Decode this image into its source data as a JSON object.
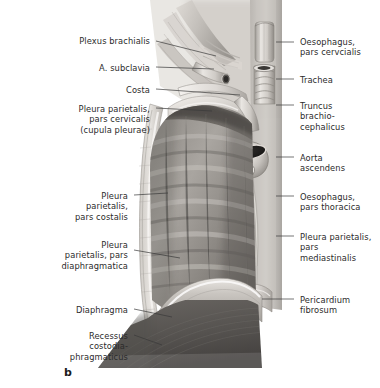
{
  "figure": {
    "letter": "b",
    "letter_x": 64,
    "letter_y": 366,
    "style": "grayscale anatomical illustration",
    "width": 380,
    "height": 388,
    "background_color": "#ffffff",
    "text_color": "#2b2b2b",
    "leader_color": "#3a3a3a"
  },
  "labels_left": [
    {
      "name": "plexus-brachialis",
      "text": "Plexus brachialis",
      "text_x": 150,
      "text_y": 36,
      "leader": {
        "x1": 156,
        "y1": 41,
        "x2": 216,
        "y2": 56
      }
    },
    {
      "name": "a-subclavia",
      "text": "A. subclavia",
      "text_y": 63,
      "text_x": 150,
      "leader": {
        "x1": 156,
        "y1": 67,
        "x2": 214,
        "y2": 69
      }
    },
    {
      "name": "costa",
      "text": "Costa",
      "text_x": 150,
      "text_y": 85,
      "leader": {
        "x1": 156,
        "y1": 89,
        "x2": 240,
        "y2": 95
      }
    },
    {
      "name": "pleura-parietalis-pars-cervicalis",
      "text": "Pleura parietalis,\npars cervicalis\n(cupula pleurae)",
      "text_x": 150,
      "text_y": 104,
      "leader": {
        "x1": 156,
        "y1": 108,
        "x2": 212,
        "y2": 111
      }
    },
    {
      "name": "pleura-parietalis-pars-costalis",
      "text": "Pleura\nparietalis,\npars costalis",
      "text_x": 128,
      "text_y": 191,
      "leader": {
        "x1": 134,
        "y1": 195,
        "x2": 168,
        "y2": 193
      }
    },
    {
      "name": "pleura-parietalis-pars-diaphragmatica",
      "text": "Pleura\nparietalis, pars\ndiaphragmatica",
      "text_x": 128,
      "text_y": 240,
      "leader": {
        "x1": 134,
        "y1": 250,
        "x2": 180,
        "y2": 258
      }
    },
    {
      "name": "diaphragma",
      "text": "Diaphragma",
      "text_x": 128,
      "text_y": 305,
      "leader": {
        "x1": 134,
        "y1": 309,
        "x2": 172,
        "y2": 317
      }
    },
    {
      "name": "recessus-costodiaphragmaticus",
      "text": "Recessus\ncostodia-\nphragmaticus",
      "text_x": 128,
      "text_y": 331,
      "leader": {
        "x1": 134,
        "y1": 335,
        "x2": 162,
        "y2": 345
      }
    }
  ],
  "labels_right": [
    {
      "name": "oesophagus-pars-cervicalis",
      "text": "Oesophagus,\npars cervcialis",
      "text_x": 300,
      "text_y": 37,
      "leader": {
        "x1": 276,
        "y1": 42,
        "x2": 294,
        "y2": 42
      }
    },
    {
      "name": "trachea",
      "text": "Trachea",
      "text_x": 300,
      "text_y": 75,
      "leader": {
        "x1": 276,
        "y1": 79,
        "x2": 294,
        "y2": 79
      }
    },
    {
      "name": "truncus-brachiocephalicus",
      "text": "Truncus\nbrachio-\ncephalicus",
      "text_x": 300,
      "text_y": 101,
      "leader": {
        "x1": 276,
        "y1": 105,
        "x2": 294,
        "y2": 105
      }
    },
    {
      "name": "aorta-ascendens",
      "text": "Aorta\nascendens",
      "text_x": 300,
      "text_y": 153,
      "leader": {
        "x1": 276,
        "y1": 157,
        "x2": 294,
        "y2": 157
      }
    },
    {
      "name": "oesophagus-pars-thoracica",
      "text": "Oesophagus,\npars thoracica",
      "text_x": 300,
      "text_y": 192,
      "leader": {
        "x1": 276,
        "y1": 196,
        "x2": 294,
        "y2": 196
      }
    },
    {
      "name": "pleura-parietalis-pars-mediastinalis",
      "text": "Pleura parietalis,\npars\nmediastinalis",
      "text_x": 300,
      "text_y": 232,
      "leader": {
        "x1": 276,
        "y1": 236,
        "x2": 294,
        "y2": 236
      }
    },
    {
      "name": "pericardium-fibrosum",
      "text": "Pericardium\nfibrosum",
      "text_x": 300,
      "text_y": 295,
      "leader": {
        "x1": 262,
        "y1": 299,
        "x2": 294,
        "y2": 299
      }
    }
  ]
}
